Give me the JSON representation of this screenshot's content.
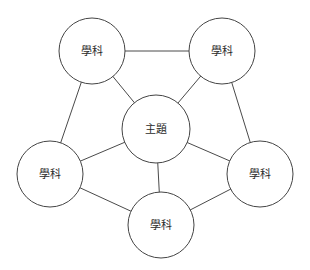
{
  "diagram": {
    "type": "concept-map",
    "layout": "radial-hub-and-spoke-pentagon",
    "background_color": "#ffffff",
    "stroke_color": "#444444",
    "text_color": "#2b2b2b",
    "center_node": {
      "id": "center",
      "label": "主題",
      "cx": 156,
      "cy": 129,
      "r": 34
    },
    "outer_nodes": [
      {
        "id": "n-top-left",
        "label": "學科",
        "cx": 92,
        "cy": 51,
        "r": 33
      },
      {
        "id": "n-top-right",
        "label": "學科",
        "cx": 222,
        "cy": 51,
        "r": 33
      },
      {
        "id": "n-left",
        "label": "學科",
        "cx": 50,
        "cy": 174,
        "r": 33
      },
      {
        "id": "n-right",
        "label": "學科",
        "cx": 260,
        "cy": 174,
        "r": 33
      },
      {
        "id": "n-bottom",
        "label": "學科",
        "cx": 161,
        "cy": 225,
        "r": 33
      }
    ],
    "spoke_edges": [
      {
        "from": "center",
        "to": "n-top-left"
      },
      {
        "from": "center",
        "to": "n-top-right"
      },
      {
        "from": "center",
        "to": "n-left"
      },
      {
        "from": "center",
        "to": "n-right"
      },
      {
        "from": "center",
        "to": "n-bottom"
      }
    ],
    "ring_edges": [
      {
        "from": "n-top-left",
        "to": "n-top-right"
      },
      {
        "from": "n-top-right",
        "to": "n-right"
      },
      {
        "from": "n-right",
        "to": "n-bottom"
      },
      {
        "from": "n-bottom",
        "to": "n-left"
      },
      {
        "from": "n-left",
        "to": "n-top-left"
      }
    ]
  }
}
